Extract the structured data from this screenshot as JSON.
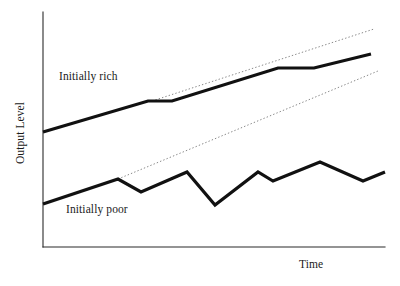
{
  "figure": {
    "background": "#ffffff",
    "ink_color": "#111111",
    "axis_color": "#2b2b2b",
    "trend_color": "#7a7a7a"
  },
  "labels": {
    "y_axis": "Output Level",
    "x_axis": "Time",
    "series_rich": "Initially rich",
    "series_poor": "Initially poor"
  },
  "chart_data": {
    "type": "line",
    "title": "",
    "subtitle": "",
    "xlabel": "Time",
    "ylabel": "Output Level",
    "xlim": [
      0,
      100
    ],
    "ylim": [
      0,
      100
    ],
    "grid": false,
    "axis_ticks": false,
    "tick_labels": {
      "x": [],
      "y": []
    },
    "legend": {
      "position": "inline-annotations",
      "entries": [
        "Initially rich",
        "Initially poor"
      ]
    },
    "annotations": [
      {
        "text": "Initially rich",
        "x": 9,
        "y": 75,
        "note": "inline label above the upper thick line"
      },
      {
        "text": "Initially poor",
        "x": 11,
        "y": 18,
        "note": "inline label below the lower zigzag line"
      }
    ],
    "series": [
      {
        "name": "Initially rich",
        "style": "solid",
        "width": "thick",
        "color": "#111111",
        "description": "Upper trajectory: steady rise interrupted by two flat plateaus",
        "x": [
          0,
          32,
          38,
          69,
          79,
          96
        ],
        "y": [
          49,
          62,
          62,
          76,
          76,
          84
        ],
        "points_px": [
          [
            43,
            132
          ],
          [
            148,
            101
          ],
          [
            172,
            101
          ],
          [
            278,
            68
          ],
          [
            314,
            68
          ],
          [
            371,
            54
          ]
        ]
      },
      {
        "name": "Initially poor",
        "style": "solid",
        "width": "thick",
        "color": "#111111",
        "description": "Lower volatile zigzag trajectory with a deep trough mid-series",
        "x": [
          0,
          22,
          29,
          42,
          50,
          57,
          63,
          68,
          81,
          94,
          100
        ],
        "y": [
          18,
          28,
          23,
          30,
          33,
          19,
          29,
          27,
          33,
          25,
          29
        ],
        "points_px": [
          [
            43,
            204
          ],
          [
            118,
            179
          ],
          [
            141,
            192
          ],
          [
            187,
            172
          ],
          [
            215,
            205
          ],
          [
            258,
            172
          ],
          [
            273,
            181
          ],
          [
            320,
            162
          ],
          [
            363,
            181
          ],
          [
            385,
            172
          ]
        ]
      },
      {
        "name": "Upper trend line",
        "style": "dotted",
        "width": "thin",
        "color": "#7a7a7a",
        "description": "Thin dotted extrapolation above the initially-rich path",
        "points_px": [
          [
            152,
            101
          ],
          [
            374,
            29
          ]
        ]
      },
      {
        "name": "Lower trend line",
        "style": "dotted",
        "width": "thin",
        "color": "#7a7a7a",
        "description": "Thin dotted extrapolation rising from the initially-poor path",
        "points_px": [
          [
            118,
            179
          ],
          [
            378,
            71
          ]
        ]
      }
    ]
  }
}
